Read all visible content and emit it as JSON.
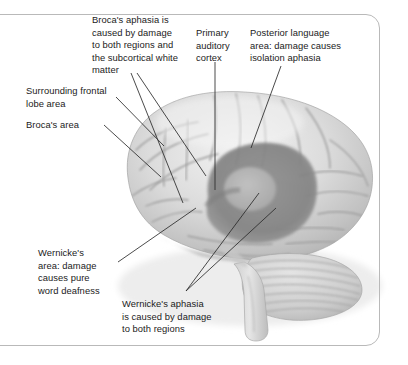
{
  "figure": {
    "image_style": "grayscale anatomical photograph illustration"
  },
  "colors": {
    "label_text": "#1b1b1b",
    "leader_line": "#2b2b2b",
    "frame_border": "#b9b9b9",
    "background": "#ffffff",
    "brain_light": "#e3e3e3",
    "brain_mid": "#c9c9c9",
    "brain_shadow": "#a8a8a8",
    "lesion_dark": "#8a8a8a",
    "lesion_inner": "#b0b0b0"
  },
  "labels": [
    {
      "id": "brocas-aphasia",
      "text": "Broca's aphasia is\ncaused by damage\nto both regions and\nthe subcortical white\nmatter",
      "x": 92,
      "y": 14,
      "width": 110
    },
    {
      "id": "primary-auditory-cortex",
      "text": "Primary\nauditory\ncortex",
      "x": 196,
      "y": 27,
      "width": 50
    },
    {
      "id": "posterior-language-area",
      "text": "Posterior language\narea: damage causes\nisolation aphasia",
      "x": 250,
      "y": 27,
      "width": 110
    },
    {
      "id": "surrounding-frontal-lobe",
      "text": "Surrounding frontal\nlobe area",
      "x": 26,
      "y": 85,
      "width": 105
    },
    {
      "id": "brocas-area",
      "text": "Broca's area",
      "x": 26,
      "y": 119,
      "width": 80
    },
    {
      "id": "wernickes-area",
      "text": "Wernicke's\narea: damage\ncauses pure\nword deafness",
      "x": 38,
      "y": 247,
      "width": 82
    },
    {
      "id": "wernickes-aphasia",
      "text": "Wernicke's aphasia\nis caused by damage\nto both regions",
      "x": 122,
      "y": 298,
      "width": 115
    }
  ],
  "leader_lines": [
    {
      "id": "leader-brocas-aphasia-a",
      "from": [
        131,
        73
      ],
      "to": [
        183,
        203
      ]
    },
    {
      "id": "leader-brocas-aphasia-b",
      "from": [
        137,
        73
      ],
      "to": [
        206,
        176
      ]
    },
    {
      "id": "leader-primary-auditory",
      "from": [
        215,
        62
      ],
      "to": [
        215,
        190
      ]
    },
    {
      "id": "leader-posterior-language",
      "from": [
        281,
        66
      ],
      "to": [
        251,
        148
      ]
    },
    {
      "id": "leader-surrounding-frontal",
      "from": [
        116,
        97
      ],
      "to": [
        164,
        146
      ]
    },
    {
      "id": "leader-brocas-area",
      "from": [
        104,
        125
      ],
      "to": [
        161,
        177
      ]
    },
    {
      "id": "leader-wernickes-area",
      "from": [
        118,
        262
      ],
      "to": [
        196,
        208
      ]
    },
    {
      "id": "leader-wernickes-aphasia-a",
      "from": [
        186,
        291
      ],
      "to": [
        259,
        193
      ]
    },
    {
      "id": "leader-wernickes-aphasia-b",
      "from": [
        186,
        291
      ],
      "to": [
        276,
        208
      ]
    }
  ],
  "brain_regions": [
    {
      "id": "frontal-lobe",
      "name": "frontal lobe"
    },
    {
      "id": "brocas-area-region",
      "name": "Broca's area"
    },
    {
      "id": "sylvian-fissure",
      "name": "lateral (Sylvian) fissure"
    },
    {
      "id": "insula",
      "name": "insula"
    },
    {
      "id": "wernickes-area-region",
      "name": "Wernicke's area"
    },
    {
      "id": "temporal-lobe",
      "name": "temporal lobe"
    },
    {
      "id": "parietal-lobe",
      "name": "parietal lobe"
    },
    {
      "id": "occipital-lobe",
      "name": "occipital lobe"
    },
    {
      "id": "cerebellum",
      "name": "cerebellum"
    },
    {
      "id": "brainstem",
      "name": "brainstem"
    }
  ]
}
